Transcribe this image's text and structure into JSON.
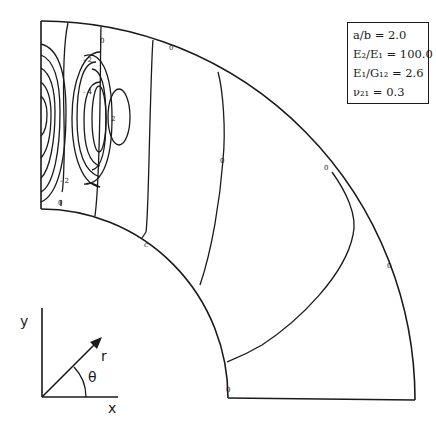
{
  "figure": {
    "type": "contour plot on quarter-annulus domain",
    "parameters": [
      {
        "label": "a/b = 2.0"
      },
      {
        "label": "E₂/E₁ = 100.0"
      },
      {
        "label": "E₁/G₁₂ = 2.6"
      },
      {
        "label": "ν₂₁ = 0.3"
      }
    ],
    "contour_labels": [
      {
        "id": "lbl-neg2-top",
        "text": "- 2"
      },
      {
        "id": "lbl-neg4",
        "text": "- 4"
      },
      {
        "id": "lbl-2",
        "text": "2"
      },
      {
        "id": "lbl-neg2-bottom",
        "text": "- 2"
      },
      {
        "id": "lbl-0-left",
        "text": "0"
      },
      {
        "id": "lbl-0-top1",
        "text": "0"
      },
      {
        "id": "lbl-0-top2",
        "text": "0"
      },
      {
        "id": "lbl-0-mid",
        "text": "0"
      },
      {
        "id": "lbl-0-inner",
        "text": "c"
      },
      {
        "id": "lbl-0-right1",
        "text": "0"
      },
      {
        "id": "lbl-0-right2",
        "text": "0"
      },
      {
        "id": "lbl-0-bottom",
        "text": "0"
      }
    ],
    "coordinate_axes": {
      "y_label": "y",
      "x_label": "x",
      "r_label": "r",
      "theta_label": "θ"
    }
  }
}
